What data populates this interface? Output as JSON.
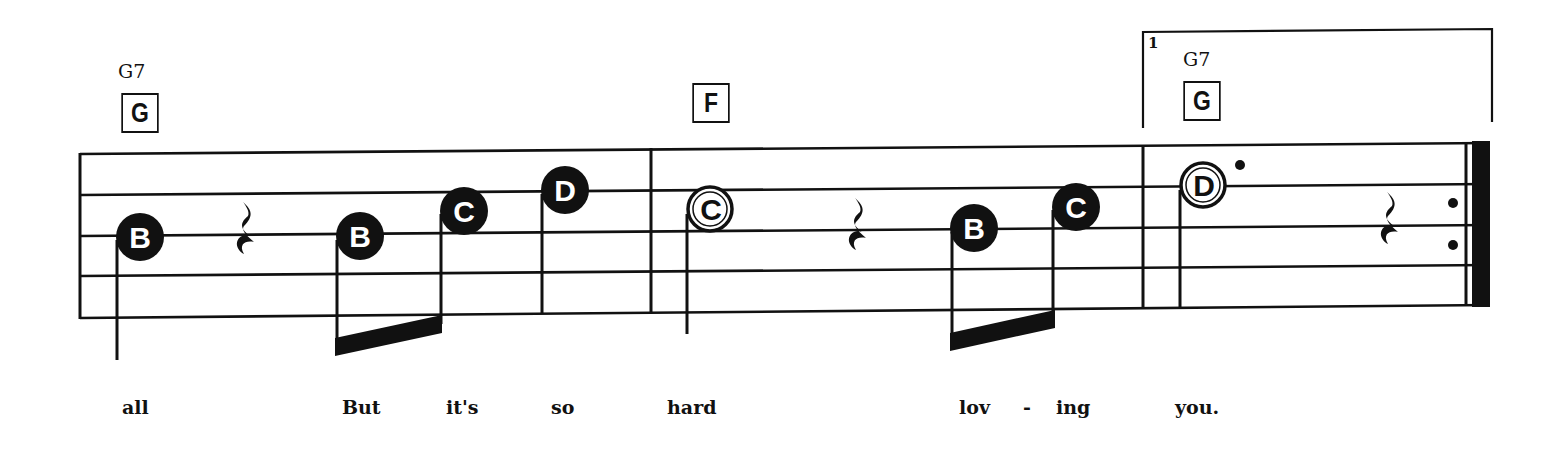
{
  "colors": {
    "ink": "#111111",
    "paper": "#ffffff"
  },
  "staff": {
    "left_x": 80,
    "right_x": 1490,
    "lines_left_y": [
      154,
      195,
      236,
      276,
      318
    ],
    "lines_right_y": [
      143,
      184,
      225,
      265,
      305
    ]
  },
  "barlines": [
    {
      "x": 651,
      "type": "single"
    },
    {
      "x": 1143,
      "type": "single"
    },
    {
      "x": 1475,
      "type": "final-repeat"
    }
  ],
  "chords": [
    {
      "name": "G7",
      "box": "G",
      "name_x": 118,
      "name_y": 60,
      "box_x": 118,
      "box_y": 93
    },
    {
      "name": "",
      "box": "F",
      "name_x": 0,
      "name_y": 0,
      "box_x": 689,
      "box_y": 83
    },
    {
      "name": "G7",
      "box": "G",
      "name_x": 1183,
      "name_y": 48,
      "box_x": 1180,
      "box_y": 81
    }
  ],
  "ending": {
    "number": "1",
    "x_start": 1143,
    "x_end": 1492,
    "y_top": 30,
    "y_bottom": 128
  },
  "notes": [
    {
      "letter": "B",
      "x": 140,
      "y": 237,
      "style": "filled",
      "stem": "down",
      "stem_x": 117,
      "stem_end": 360
    },
    {
      "letter": "rest",
      "x": 246,
      "y": 232,
      "style": "quarter-rest"
    },
    {
      "letter": "B",
      "x": 360,
      "y": 236,
      "style": "filled",
      "stem": "down",
      "stem_x": 337,
      "beam_group": 1
    },
    {
      "letter": "C",
      "x": 464,
      "y": 211,
      "style": "filled",
      "stem": "down",
      "stem_x": 441,
      "beam_group": 1
    },
    {
      "letter": "D",
      "x": 565,
      "y": 190,
      "style": "filled",
      "stem": "down",
      "stem_x": 542,
      "stem_end": 314
    },
    {
      "letter": "C",
      "x": 710,
      "y": 209,
      "style": "hollow",
      "stem": "down",
      "stem_x": 687,
      "stem_end": 334
    },
    {
      "letter": "rest",
      "x": 858,
      "y": 228,
      "style": "quarter-rest"
    },
    {
      "letter": "B",
      "x": 974,
      "y": 228,
      "style": "filled",
      "stem": "down",
      "stem_x": 952,
      "beam_group": 2
    },
    {
      "letter": "C",
      "x": 1076,
      "y": 207,
      "style": "filled",
      "stem": "down",
      "stem_x": 1053,
      "beam_group": 2
    },
    {
      "letter": "D",
      "x": 1203,
      "y": 185,
      "style": "hollow-dotted",
      "stem": "down",
      "stem_x": 1180,
      "stem_end": 307
    },
    {
      "letter": "rest",
      "x": 1390,
      "y": 222,
      "style": "quarter-rest"
    }
  ],
  "beams": [
    {
      "x1": 337,
      "y1_top": 341,
      "x2": 441,
      "y2_top": 316
    },
    {
      "x1": 952,
      "y1_top": 336,
      "x2": 1053,
      "y2_top": 312
    }
  ],
  "lyrics": [
    {
      "text": "all",
      "x": 122
    },
    {
      "text": "But",
      "x": 342
    },
    {
      "text": "it's",
      "x": 446
    },
    {
      "text": "so",
      "x": 551
    },
    {
      "text": "hard",
      "x": 667
    },
    {
      "text": "lov",
      "x": 959
    },
    {
      "text": "-",
      "x": 1023
    },
    {
      "text": "ing",
      "x": 1056
    },
    {
      "text": "you.",
      "x": 1175
    }
  ]
}
